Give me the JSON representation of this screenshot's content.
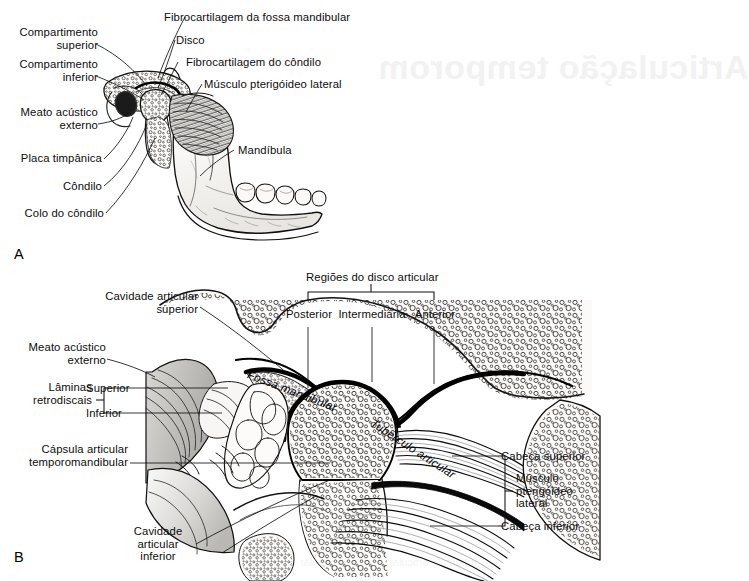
{
  "figure": {
    "language": "pt-BR",
    "panels": [
      {
        "letter": "A",
        "caption": "Vista lateral da mandibula e articulacao temporomandibular"
      },
      {
        "letter": "B",
        "caption": "Corte sagital da articulacao temporomandibular"
      }
    ]
  },
  "bleedthrough": {
    "title": "Articulação temporom",
    "line1": "noitslunithA",
    "bottom": "tubérculo articular e o disco articular"
  },
  "panelA": {
    "letter": "A",
    "labels": {
      "compartimento_superior": "Compartimento\nsuperior",
      "compartimento_inferior": "Compartimento\ninferior",
      "meato_acustico_externo": "Meato acústico\nexterno",
      "placa_timpanica": "Placa timpânica",
      "condilo": "Côndilo",
      "colo_do_condilo": "Colo do côndilo",
      "fibrocartilagem_fossa": "Fibrocartilagem da fossa mandibular",
      "disco": "Disco",
      "fibrocartilagem_condilo": "Fibrocartilagem do côndilo",
      "musculo_pterigoideo_lateral": "Músculo pterigóideo lateral",
      "mandibula": "Mandíbula"
    }
  },
  "panelB": {
    "letter": "B",
    "labels": {
      "cavidade_articular_superior": "Cavidade articular\nsuperior",
      "meato_acustico_externo": "Meato acústico\nexterno",
      "laminas_retrodiscais": "Lâminas\nretrodiscais",
      "lamina_superior": "Superior",
      "lamina_inferior": "Inferior",
      "capsula_articular": "Cápsula articular\ntemporomandibular",
      "cavidade_articular_inferior": "Cavidade\narticular\ninferior",
      "regioes_do_disco": "Regiões do disco articular",
      "regiao_posterior": "Posterior",
      "regiao_intermediaria": "Intermediária",
      "regiao_anterior": "Anterior",
      "cabeca_superior": "Cabeça superior",
      "cabeca_inferior": "Cabeça inferior",
      "musculo_pterigoideo_lateral": "Músculo\npterigóideo\nlateral",
      "fossa_mandibular": "Fossa mandibular",
      "tuberculo_articular": "Tubérculo articular"
    }
  },
  "colors": {
    "ink": "#0d0d0d",
    "background": "#ffffff",
    "bone_fill": "#f4f3f0",
    "disc_outline": "#000000",
    "bleed": "#f2f2f2"
  }
}
